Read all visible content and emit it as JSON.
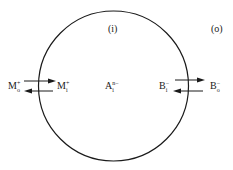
{
  "diagram": {
    "region_inside": "(i)",
    "region_outside": "(o)",
    "species": {
      "cation_out": {
        "base": "M",
        "sub": "o",
        "sup": "+"
      },
      "cation_in": {
        "base": "M",
        "sub": "i",
        "sup": "+"
      },
      "anion_in_fixed": {
        "base": "A",
        "sub": "i",
        "sup": "n−"
      },
      "anion_in": {
        "base": "B",
        "sub": "i",
        "sup": "−"
      },
      "anion_out": {
        "base": "B",
        "sub": "o",
        "sup": "−"
      }
    },
    "colors": {
      "stroke": "#1a1a1a",
      "background": "#ffffff"
    }
  }
}
